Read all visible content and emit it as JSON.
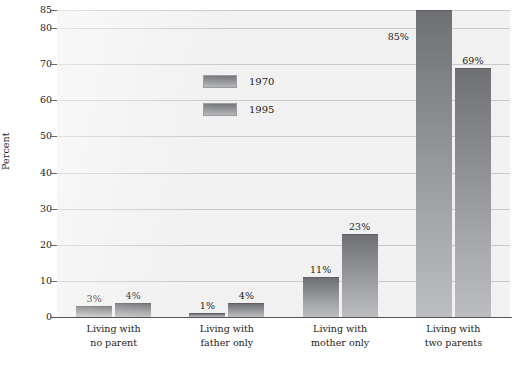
{
  "chart_data": {
    "type": "bar",
    "title": "",
    "subtitle": "",
    "xlabel": "",
    "ylabel": "Percent",
    "ylim": [
      0,
      85
    ],
    "grid": true,
    "legend_position": "inside-upper-left",
    "yticks": [
      0,
      10,
      20,
      30,
      40,
      50,
      60,
      70,
      80,
      85
    ],
    "ytick_labels": [
      "0",
      "10",
      "20",
      "30",
      "40",
      "50",
      "60",
      "70",
      "80",
      "85"
    ],
    "categories": [
      "Living with\nno parent",
      "Living with\nfather only",
      "Living with\nmother only",
      "Living with\ntwo parents"
    ],
    "series": [
      {
        "name": "1970",
        "values": [
          3,
          1,
          11,
          85
        ],
        "labels": [
          "3%",
          "1%",
          "11%",
          "85%"
        ]
      },
      {
        "name": "1995",
        "values": [
          4,
          4,
          23,
          69
        ],
        "labels": [
          "4%",
          "4%",
          "23%",
          "69%"
        ]
      }
    ],
    "colors": {
      "bar_top": "#6f7073",
      "bar_bottom": "#bcbdc0",
      "plot_background": "#f1f1f1",
      "gridline": "#c9c9c9",
      "axis": "#555555",
      "text": "#1c1c1c"
    }
  },
  "legend": {
    "entries": [
      {
        "label": "1970"
      },
      {
        "label": "1995"
      }
    ]
  }
}
